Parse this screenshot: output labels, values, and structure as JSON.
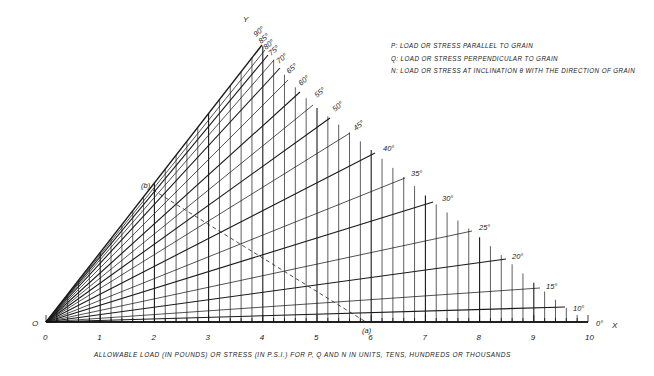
{
  "chart_data": {
    "type": "line",
    "title": "",
    "xlabel": "ALLOWABLE  LOAD (IN POUNDS) OR STRESS (IN P.S.I.) FOR P, Q AND N IN UNITS, TENS, HUNDREDS OR THOUSANDS",
    "ylabel": "Y",
    "x_axis_name": "X",
    "origin_label": "O",
    "x_ticks": [
      "0",
      "1",
      "2",
      "3",
      "4",
      "5",
      "6",
      "7",
      "8",
      "9",
      "10"
    ],
    "xlim": [
      0,
      10
    ],
    "minor_tick_step": 0.2,
    "grid": true,
    "legend": [
      "P: LOAD OR STRESS PARALLEL TO GRAIN",
      "Q: LOAD OR STRESS PERPENDICULAR TO GRAIN",
      "N: LOAD OR STRESS AT INCLINATION θ WITH THE DIRECTION OF GRAIN"
    ],
    "legend_position": "top-right",
    "angle_lines_deg": [
      90,
      85,
      80,
      75,
      70,
      65,
      60,
      55,
      50,
      45,
      40,
      35,
      30,
      25,
      20,
      15,
      10,
      0
    ],
    "angle_labels": [
      "90°",
      "85°",
      "80°",
      "75°",
      "70°",
      "65°",
      "60°",
      "55°",
      "50°",
      "45°",
      "40°",
      "35°",
      "30°",
      "25°",
      "20°",
      "15°",
      "10°",
      "0°"
    ],
    "annotations": [
      {
        "label": "(a)",
        "x": 5.9,
        "note": "point on X axis"
      },
      {
        "label": "(b)",
        "x": 2.0,
        "note": "point on Y (90°) line, joined to (a) by dashed line"
      }
    ]
  },
  "pixels": {
    "origin": [
      46,
      322
    ],
    "unit": 54.2,
    "endpoints": {
      "90": [
        262,
        45
      ],
      "85": [
        265,
        50
      ],
      "80": [
        268,
        55
      ],
      "75": [
        274,
        60
      ],
      "70": [
        280,
        68
      ],
      "65": [
        288,
        80
      ],
      "60": [
        300,
        92
      ],
      "55": [
        313,
        105
      ],
      "50": [
        330,
        118
      ],
      "45": [
        350,
        133
      ],
      "40": [
        375,
        153
      ],
      "35": [
        405,
        178
      ],
      "30": [
        433,
        202
      ],
      "25": [
        472,
        231
      ],
      "20": [
        506,
        259
      ],
      "15": [
        540,
        288
      ],
      "10": [
        565,
        307
      ],
      "0": [
        588,
        322
      ]
    },
    "label_pos": {
      "90": [
        256,
        37
      ],
      "85": [
        261,
        44
      ],
      "80": [
        266,
        50
      ],
      "75": [
        271,
        56
      ],
      "70": [
        279,
        64
      ],
      "65": [
        289,
        74
      ],
      "60": [
        301,
        86
      ],
      "55": [
        317,
        98
      ],
      "50": [
        335,
        112
      ],
      "45": [
        356,
        131
      ],
      "40": [
        383,
        151
      ],
      "35": [
        411,
        176
      ],
      "30": [
        442,
        201
      ],
      "25": [
        479,
        230
      ],
      "20": [
        512,
        259
      ],
      "15": [
        546,
        289
      ],
      "10": [
        573,
        311
      ],
      "0": [
        596,
        326
      ]
    },
    "point_a": [
      366,
      322
    ],
    "point_b": [
      153,
      190
    ]
  }
}
